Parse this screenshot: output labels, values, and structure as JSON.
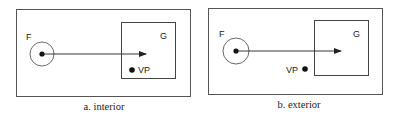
{
  "panels": [
    {
      "id": "a",
      "caption": "a. interior",
      "focus_label": "F",
      "goal_label": "G",
      "vp_label": "VP",
      "vp_position": "inside goal region"
    },
    {
      "id": "b",
      "caption": "b. exterior",
      "focus_label": "F",
      "goal_label": "G",
      "vp_label": "VP",
      "vp_position": "outside goal region"
    }
  ],
  "colors": {
    "stroke": "#333333",
    "frame": "#555555",
    "text": "#222222",
    "background": "#ffffff"
  }
}
